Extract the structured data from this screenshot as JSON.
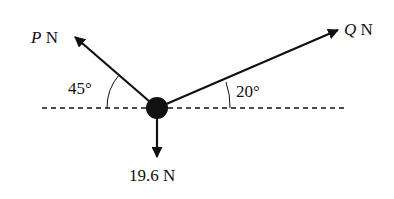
{
  "diagram": {
    "title": "",
    "forces": {
      "P": {
        "symbol": "P",
        "unit": "N",
        "angle_label": "45°",
        "angle_deg": 45,
        "direction": "up-left"
      },
      "Q": {
        "symbol": "Q",
        "unit": "N",
        "angle_label": "20°",
        "angle_deg": 20,
        "direction": "up-right"
      },
      "W": {
        "label": "19.6 N",
        "direction": "down"
      }
    },
    "reference_line": "horizontal dashed",
    "colors": {
      "ink": "#111111",
      "background": "#ffffff"
    }
  }
}
